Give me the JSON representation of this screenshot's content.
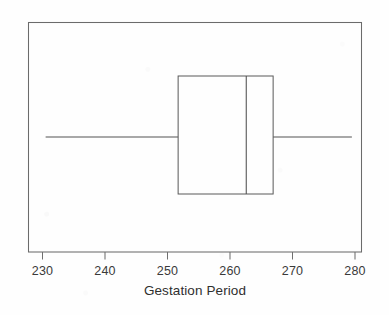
{
  "chart_data": {
    "type": "box",
    "title": "",
    "xlabel": "Gestation Period",
    "ylabel": "",
    "xlim": [
      227.8,
      283.4
    ],
    "xticks": [
      230,
      240,
      250,
      260,
      270,
      280
    ],
    "xticklabels": [
      "230",
      "240",
      "250",
      "260",
      "270",
      "280"
    ],
    "grid": false,
    "legend": "none",
    "orientation": "horizontal",
    "boxes": [
      {
        "name": "Gestation Period",
        "whisker_low": 230.5,
        "q1": 251.7,
        "median": 262.6,
        "q3": 266.9,
        "whisker_high": 279.5,
        "outliers": [],
        "whisker_caps": false
      }
    ],
    "colors": {
      "box_stroke": "#595959",
      "median_stroke": "#4f4f4f",
      "whisker_stroke": "#4a4a4a",
      "frame_stroke": "#6b6b6b",
      "box_fill": "none",
      "background": "#fefefe",
      "text": "#2f2f2f"
    }
  },
  "axis": {
    "title": "Gestation Period",
    "tick_labels": [
      "230",
      "240",
      "250",
      "260",
      "270",
      "280"
    ]
  }
}
